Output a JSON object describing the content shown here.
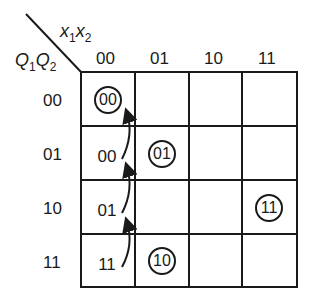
{
  "diagram": {
    "type": "karnaugh-map",
    "column_variable_label": {
      "v1": "x",
      "s1": "1",
      "v2": "x",
      "s2": "2"
    },
    "row_variable_label": {
      "v1": "Q",
      "s1": "1",
      "v2": "Q",
      "s2": "2"
    },
    "column_headers": [
      "00",
      "01",
      "10",
      "11"
    ],
    "row_headers": [
      "00",
      "01",
      "10",
      "11"
    ],
    "cells": [
      {
        "row": 0,
        "col": 0,
        "text": "00",
        "circled": true
      },
      {
        "row": 1,
        "col": 0,
        "text": "00",
        "circled": false
      },
      {
        "row": 1,
        "col": 1,
        "text": "01",
        "circled": true
      },
      {
        "row": 2,
        "col": 0,
        "text": "01",
        "circled": false
      },
      {
        "row": 2,
        "col": 3,
        "text": "11",
        "circled": true
      },
      {
        "row": 3,
        "col": 0,
        "text": "11",
        "circled": false
      },
      {
        "row": 3,
        "col": 1,
        "text": "10",
        "circled": true
      }
    ],
    "arrows": [
      {
        "from": "row3-col0",
        "to": "row2-col0"
      },
      {
        "from": "row2-col0",
        "to": "row1-col0"
      },
      {
        "from": "row1-col0",
        "to": "row0-col0"
      }
    ],
    "line_color": "#1a1a1a"
  }
}
